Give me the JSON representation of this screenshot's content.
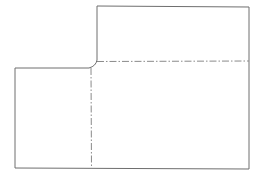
{
  "drawing": {
    "type": "technical-drawing",
    "description": "L-shaped part outline with filleted inner corner and two dash-dot center lines",
    "colors": {
      "background": "#ffffff",
      "outline": "#6e6e6e",
      "centerline": "#8a8a8a"
    },
    "outline_points": [
      [
        97,
        6
      ],
      [
        249,
        7
      ],
      [
        249,
        169
      ],
      [
        15,
        168
      ],
      [
        15,
        68
      ],
      [
        89,
        68
      ],
      [
        97,
        60
      ]
    ],
    "fillet": {
      "from": [
        89,
        68
      ],
      "to": [
        97,
        60
      ],
      "control": [
        96,
        66
      ]
    },
    "centerlines": [
      {
        "orientation": "horizontal",
        "y": 61,
        "x1": 97,
        "x2": 249
      },
      {
        "orientation": "vertical",
        "x": 91,
        "y1": 68,
        "y2": 169
      }
    ]
  }
}
